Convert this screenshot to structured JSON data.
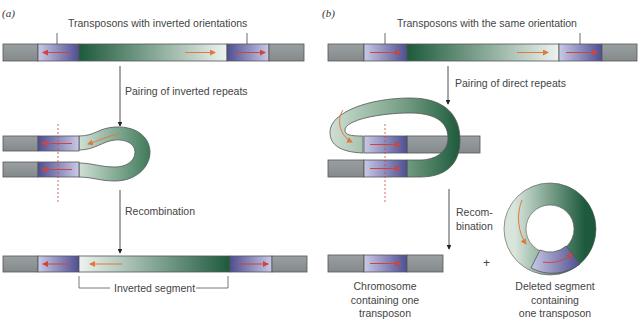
{
  "panel_a": {
    "label": "(a)",
    "title": "Transposons with inverted orientations",
    "step1": "Pairing of inverted repeats",
    "step2": "Recombination",
    "result": "Inverted segment"
  },
  "panel_b": {
    "label": "(b)",
    "title": "Transposons with the same orientation",
    "step1": "Pairing of direct repeats",
    "step2_line1": "Recom-",
    "step2_line2": "bination",
    "plus": "+",
    "result_left_lines": [
      "Chromosome",
      "containing one",
      "transposon"
    ],
    "result_right_lines": [
      "Deleted segment",
      "containing",
      "one transposon"
    ]
  },
  "colors": {
    "chromosome_gray": "#8e9496",
    "transposon_blue": "#5b5a9e",
    "segment_green": "#1f5a3e",
    "arrow_red": "#d0453a",
    "arrow_orange": "#e07a3a"
  }
}
